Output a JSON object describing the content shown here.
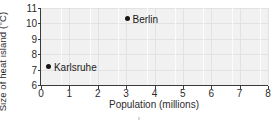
{
  "chart_data": {
    "type": "scatter",
    "title": "",
    "xlabel": "Population (millions)",
    "ylabel": "Size of heat island (°C)",
    "xlim": [
      0,
      8
    ],
    "ylim": [
      6,
      11
    ],
    "xticks": [
      "0",
      "1",
      "2",
      "3",
      "4",
      "5",
      "6",
      "7",
      "8"
    ],
    "yticks": [
      "6",
      "7",
      "8",
      "9",
      "10",
      "11"
    ],
    "grid": true,
    "legend": "none",
    "points": [
      {
        "label": "Karlsruhe",
        "x": 0.28,
        "y": 7.2
      },
      {
        "label": "Berlin",
        "x": 3.05,
        "y": 10.3
      }
    ],
    "colors": {
      "marker": "#151515",
      "plot_background": "#f1f1f1",
      "gridline": "#e2e2e2",
      "axis": "#3a3a3a",
      "text": "#2b2b2b",
      "figure_background": "#ffffff"
    }
  }
}
